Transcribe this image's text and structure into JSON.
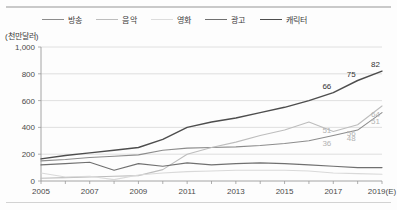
{
  "figure": {
    "unit_caption": "(천만달러)",
    "legend_position": "top"
  },
  "chart_data": {
    "type": "line",
    "title": "",
    "subtitle": "",
    "xlabel": "",
    "ylabel": "(천만달러)",
    "ylim": [
      0,
      1000
    ],
    "ytick_labels": [
      "0",
      "200",
      "400",
      "600",
      "800",
      "1,000"
    ],
    "ytick_values": [
      0,
      200,
      400,
      600,
      800,
      1000
    ],
    "xtick_labels": [
      "2005",
      "2007",
      "2009",
      "2011",
      "2013",
      "2015",
      "2017",
      "2019(E)"
    ],
    "xtick_values": [
      2005,
      2007,
      2009,
      2011,
      2013,
      2015,
      2017,
      2019
    ],
    "x": [
      2005,
      2006,
      2007,
      2008,
      2009,
      2010,
      2011,
      2012,
      2013,
      2014,
      2015,
      2016,
      2017,
      2018,
      2019
    ],
    "grid": "horizontal",
    "legend_entries": [
      "방송",
      "음악",
      "영화",
      "광고",
      "캐릭터"
    ],
    "series": [
      {
        "name": "방송",
        "color": "#8c8c8c",
        "width": 1.1,
        "values": [
          150,
          160,
          175,
          185,
          195,
          230,
          245,
          250,
          255,
          265,
          280,
          300,
          340,
          380,
          510
        ]
      },
      {
        "name": "음악",
        "color": "#bdbdbd",
        "width": 1.1,
        "values": [
          20,
          25,
          30,
          35,
          40,
          85,
          200,
          250,
          290,
          340,
          380,
          440,
          370,
          420,
          560
        ]
      },
      {
        "name": "영화",
        "color": "#d9d9d9",
        "width": 1.1,
        "values": [
          60,
          30,
          35,
          10,
          45,
          60,
          70,
          75,
          80,
          80,
          80,
          75,
          60,
          55,
          50
        ]
      },
      {
        "name": "광고",
        "color": "#707070",
        "width": 1.2,
        "values": [
          120,
          130,
          140,
          80,
          130,
          110,
          135,
          120,
          130,
          135,
          130,
          120,
          110,
          100,
          100
        ]
      },
      {
        "name": "캐릭터",
        "color": "#4d4d4d",
        "width": 1.4,
        "values": [
          165,
          190,
          210,
          230,
          250,
          310,
          400,
          440,
          470,
          510,
          550,
          600,
          660,
          750,
          820
        ]
      }
    ],
    "data_labels": [
      {
        "text": "82",
        "x": 2019,
        "value": 820,
        "series": "캐릭터",
        "color": "#333333"
      },
      {
        "text": "75",
        "x": 2018,
        "value": 750,
        "series": "캐릭터",
        "color": "#333333"
      },
      {
        "text": "66",
        "x": 2017,
        "value": 660,
        "series": "캐릭터",
        "color": "#333333"
      },
      {
        "text": "64",
        "x": 2019,
        "value": 560,
        "series": "음악",
        "color": "#b3b3b3"
      },
      {
        "text": "56",
        "x": 2018,
        "value": 420,
        "series": "음악",
        "color": "#b3b3b3"
      },
      {
        "text": "51",
        "x": 2017,
        "value": 440,
        "series": "음악",
        "color": "#b3b3b3"
      },
      {
        "text": "51",
        "x": 2019,
        "value": 510,
        "series": "방송",
        "color": "#b3b3b3"
      },
      {
        "text": "48",
        "x": 2018,
        "value": 380,
        "series": "방송",
        "color": "#b3b3b3"
      },
      {
        "text": "36",
        "x": 2017,
        "value": 340,
        "series": "방송",
        "color": "#b3b3b3"
      }
    ]
  }
}
